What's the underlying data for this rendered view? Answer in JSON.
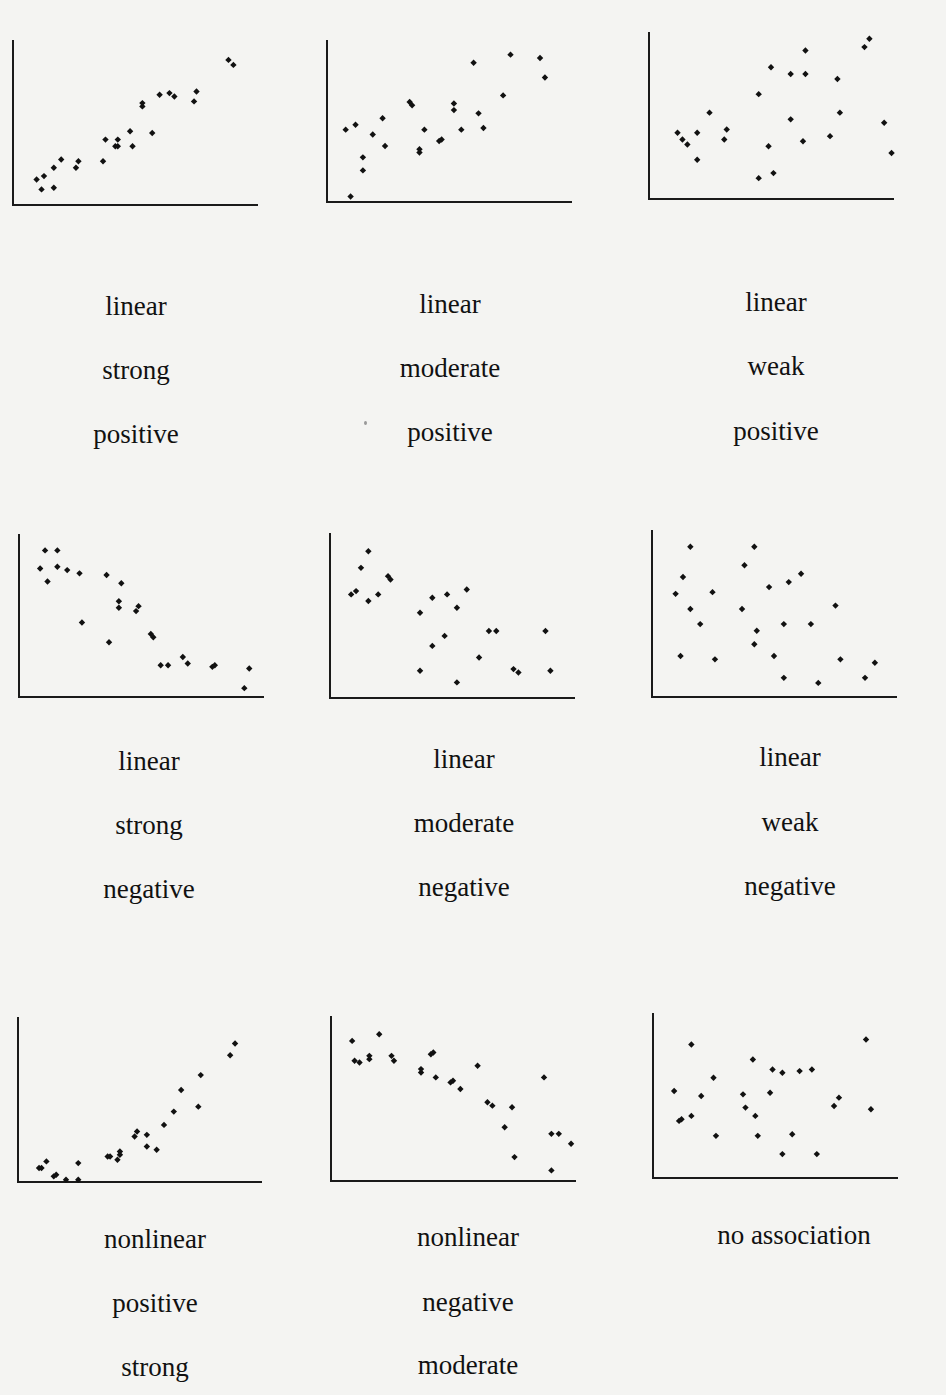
{
  "chart_data": [
    {
      "type": "scatter",
      "title": "linear strong positive",
      "labels": [
        "linear",
        "strong",
        "positive"
      ],
      "form": "linear",
      "strength": "strong",
      "direction": "positive",
      "xlabel": "",
      "ylabel": "",
      "grid": false,
      "legend": null,
      "frame": {
        "x": 12,
        "y": 40,
        "w": 246,
        "h": 166
      },
      "points": [
        [
          0.1,
          0.16
        ],
        [
          0.12,
          0.1
        ],
        [
          0.13,
          0.18
        ],
        [
          0.17,
          0.11
        ],
        [
          0.17,
          0.23
        ],
        [
          0.2,
          0.28
        ],
        [
          0.26,
          0.23
        ],
        [
          0.27,
          0.27
        ],
        [
          0.37,
          0.27
        ],
        [
          0.38,
          0.4
        ],
        [
          0.42,
          0.36
        ],
        [
          0.43,
          0.4
        ],
        [
          0.43,
          0.36
        ],
        [
          0.48,
          0.45
        ],
        [
          0.49,
          0.36
        ],
        [
          0.53,
          0.6
        ],
        [
          0.53,
          0.62
        ],
        [
          0.57,
          0.44
        ],
        [
          0.6,
          0.67
        ],
        [
          0.64,
          0.68
        ],
        [
          0.66,
          0.66
        ],
        [
          0.74,
          0.63
        ],
        [
          0.75,
          0.69
        ],
        [
          0.88,
          0.88
        ],
        [
          0.9,
          0.85
        ]
      ]
    },
    {
      "type": "scatter",
      "title": "linear moderate positive",
      "labels": [
        "linear",
        "moderate",
        "positive"
      ],
      "form": "linear",
      "strength": "moderate",
      "direction": "positive",
      "xlabel": "",
      "ylabel": "",
      "grid": false,
      "legend": null,
      "frame": {
        "x": 326,
        "y": 40,
        "w": 246,
        "h": 163
      },
      "points": [
        [
          0.1,
          0.04
        ],
        [
          0.08,
          0.45
        ],
        [
          0.12,
          0.48
        ],
        [
          0.15,
          0.28
        ],
        [
          0.15,
          0.2
        ],
        [
          0.19,
          0.42
        ],
        [
          0.23,
          0.52
        ],
        [
          0.24,
          0.35
        ],
        [
          0.34,
          0.62
        ],
        [
          0.35,
          0.6
        ],
        [
          0.38,
          0.31
        ],
        [
          0.4,
          0.45
        ],
        [
          0.38,
          0.33
        ],
        [
          0.46,
          0.38
        ],
        [
          0.47,
          0.39
        ],
        [
          0.52,
          0.61
        ],
        [
          0.52,
          0.57
        ],
        [
          0.55,
          0.45
        ],
        [
          0.62,
          0.55
        ],
        [
          0.64,
          0.46
        ],
        [
          0.6,
          0.86
        ],
        [
          0.72,
          0.66
        ],
        [
          0.75,
          0.91
        ],
        [
          0.87,
          0.89
        ],
        [
          0.89,
          0.77
        ]
      ]
    },
    {
      "type": "scatter",
      "title": "linear weak positive",
      "labels": [
        "linear",
        "weak",
        "positive"
      ],
      "form": "linear",
      "strength": "weak",
      "direction": "positive",
      "xlabel": "",
      "ylabel": "",
      "grid": false,
      "legend": null,
      "frame": {
        "x": 648,
        "y": 32,
        "w": 246,
        "h": 168
      },
      "points": [
        [
          0.12,
          0.4
        ],
        [
          0.14,
          0.36
        ],
        [
          0.16,
          0.33
        ],
        [
          0.2,
          0.4
        ],
        [
          0.2,
          0.24
        ],
        [
          0.25,
          0.52
        ],
        [
          0.31,
          0.36
        ],
        [
          0.32,
          0.42
        ],
        [
          0.45,
          0.13
        ],
        [
          0.45,
          0.63
        ],
        [
          0.49,
          0.32
        ],
        [
          0.5,
          0.79
        ],
        [
          0.51,
          0.16
        ],
        [
          0.58,
          0.48
        ],
        [
          0.58,
          0.75
        ],
        [
          0.63,
          0.35
        ],
        [
          0.64,
          0.75
        ],
        [
          0.64,
          0.89
        ],
        [
          0.74,
          0.38
        ],
        [
          0.77,
          0.72
        ],
        [
          0.78,
          0.52
        ],
        [
          0.88,
          0.91
        ],
        [
          0.9,
          0.96
        ],
        [
          0.96,
          0.46
        ],
        [
          0.99,
          0.28
        ]
      ]
    },
    {
      "type": "scatter",
      "title": "linear strong negative",
      "labels": [
        "linear",
        "strong",
        "negative"
      ],
      "form": "linear",
      "strength": "strong",
      "direction": "negative",
      "xlabel": "",
      "ylabel": "",
      "grid": false,
      "legend": null,
      "frame": {
        "x": 18,
        "y": 534,
        "w": 246,
        "h": 164
      },
      "points": [
        [
          0.09,
          0.79
        ],
        [
          0.11,
          0.9
        ],
        [
          0.12,
          0.71
        ],
        [
          0.16,
          0.9
        ],
        [
          0.16,
          0.8
        ],
        [
          0.2,
          0.78
        ],
        [
          0.25,
          0.76
        ],
        [
          0.26,
          0.46
        ],
        [
          0.36,
          0.75
        ],
        [
          0.37,
          0.34
        ],
        [
          0.42,
          0.7
        ],
        [
          0.41,
          0.59
        ],
        [
          0.41,
          0.55
        ],
        [
          0.48,
          0.53
        ],
        [
          0.49,
          0.56
        ],
        [
          0.54,
          0.39
        ],
        [
          0.55,
          0.37
        ],
        [
          0.58,
          0.2
        ],
        [
          0.61,
          0.2
        ],
        [
          0.67,
          0.25
        ],
        [
          0.69,
          0.21
        ],
        [
          0.79,
          0.19
        ],
        [
          0.8,
          0.2
        ],
        [
          0.92,
          0.06
        ],
        [
          0.94,
          0.18
        ]
      ]
    },
    {
      "type": "scatter",
      "title": "linear moderate negative",
      "labels": [
        "linear",
        "moderate",
        "negative"
      ],
      "form": "linear",
      "strength": "moderate",
      "direction": "negative",
      "xlabel": "",
      "ylabel": "",
      "grid": false,
      "legend": null,
      "frame": {
        "x": 329,
        "y": 533,
        "w": 246,
        "h": 166
      },
      "points": [
        [
          0.09,
          0.63
        ],
        [
          0.11,
          0.65
        ],
        [
          0.13,
          0.79
        ],
        [
          0.16,
          0.89
        ],
        [
          0.16,
          0.59
        ],
        [
          0.2,
          0.63
        ],
        [
          0.24,
          0.74
        ],
        [
          0.25,
          0.72
        ],
        [
          0.37,
          0.52
        ],
        [
          0.37,
          0.17
        ],
        [
          0.42,
          0.61
        ],
        [
          0.42,
          0.32
        ],
        [
          0.47,
          0.38
        ],
        [
          0.48,
          0.63
        ],
        [
          0.52,
          0.55
        ],
        [
          0.52,
          0.1
        ],
        [
          0.56,
          0.66
        ],
        [
          0.61,
          0.25
        ],
        [
          0.65,
          0.41
        ],
        [
          0.68,
          0.41
        ],
        [
          0.75,
          0.18
        ],
        [
          0.77,
          0.16
        ],
        [
          0.88,
          0.41
        ],
        [
          0.9,
          0.17
        ]
      ]
    },
    {
      "type": "scatter",
      "title": "linear weak negative",
      "labels": [
        "linear",
        "weak",
        "negative"
      ],
      "form": "linear",
      "strength": "weak",
      "direction": "negative",
      "xlabel": "",
      "ylabel": "",
      "grid": false,
      "legend": null,
      "frame": {
        "x": 651,
        "y": 530,
        "w": 246,
        "h": 168
      },
      "points": [
        [
          0.1,
          0.62
        ],
        [
          0.12,
          0.25
        ],
        [
          0.13,
          0.72
        ],
        [
          0.16,
          0.9
        ],
        [
          0.16,
          0.53
        ],
        [
          0.2,
          0.44
        ],
        [
          0.25,
          0.63
        ],
        [
          0.26,
          0.23
        ],
        [
          0.37,
          0.53
        ],
        [
          0.38,
          0.79
        ],
        [
          0.42,
          0.9
        ],
        [
          0.42,
          0.32
        ],
        [
          0.43,
          0.4
        ],
        [
          0.5,
          0.25
        ],
        [
          0.48,
          0.66
        ],
        [
          0.54,
          0.44
        ],
        [
          0.54,
          0.12
        ],
        [
          0.56,
          0.69
        ],
        [
          0.61,
          0.74
        ],
        [
          0.65,
          0.44
        ],
        [
          0.68,
          0.09
        ],
        [
          0.75,
          0.55
        ],
        [
          0.77,
          0.23
        ],
        [
          0.87,
          0.12
        ],
        [
          0.91,
          0.21
        ]
      ]
    },
    {
      "type": "scatter",
      "title": "nonlinear positive strong",
      "labels": [
        "nonlinear",
        "positive",
        "strong"
      ],
      "form": "nonlinear",
      "strength": "strong",
      "direction": "positive",
      "xlabel": "",
      "ylabel": "",
      "grid": false,
      "legend": null,
      "frame": {
        "x": 17,
        "y": 1017,
        "w": 245,
        "h": 166
      },
      "points": [
        [
          0.09,
          0.09
        ],
        [
          0.1,
          0.09
        ],
        [
          0.12,
          0.13
        ],
        [
          0.15,
          0.04
        ],
        [
          0.16,
          0.05
        ],
        [
          0.2,
          0.02
        ],
        [
          0.25,
          0.12
        ],
        [
          0.25,
          0.02
        ],
        [
          0.37,
          0.16
        ],
        [
          0.38,
          0.16
        ],
        [
          0.41,
          0.14
        ],
        [
          0.42,
          0.19
        ],
        [
          0.42,
          0.17
        ],
        [
          0.48,
          0.28
        ],
        [
          0.49,
          0.31
        ],
        [
          0.53,
          0.22
        ],
        [
          0.53,
          0.29
        ],
        [
          0.57,
          0.2
        ],
        [
          0.6,
          0.35
        ],
        [
          0.64,
          0.43
        ],
        [
          0.67,
          0.56
        ],
        [
          0.74,
          0.46
        ],
        [
          0.75,
          0.65
        ],
        [
          0.87,
          0.77
        ],
        [
          0.89,
          0.84
        ]
      ]
    },
    {
      "type": "scatter",
      "title": "nonlinear negative moderate",
      "labels": [
        "nonlinear",
        "negative",
        "moderate"
      ],
      "form": "nonlinear",
      "strength": "moderate",
      "direction": "negative",
      "xlabel": "",
      "ylabel": "",
      "grid": false,
      "legend": null,
      "frame": {
        "x": 330,
        "y": 1016,
        "w": 246,
        "h": 166
      },
      "points": [
        [
          0.09,
          0.85
        ],
        [
          0.1,
          0.73
        ],
        [
          0.12,
          0.72
        ],
        [
          0.16,
          0.74
        ],
        [
          0.16,
          0.76
        ],
        [
          0.2,
          0.89
        ],
        [
          0.25,
          0.76
        ],
        [
          0.26,
          0.73
        ],
        [
          0.37,
          0.66
        ],
        [
          0.37,
          0.68
        ],
        [
          0.41,
          0.77
        ],
        [
          0.42,
          0.78
        ],
        [
          0.43,
          0.63
        ],
        [
          0.49,
          0.6
        ],
        [
          0.5,
          0.61
        ],
        [
          0.53,
          0.56
        ],
        [
          0.6,
          0.7
        ],
        [
          0.64,
          0.48
        ],
        [
          0.66,
          0.46
        ],
        [
          0.71,
          0.33
        ],
        [
          0.74,
          0.45
        ],
        [
          0.75,
          0.15
        ],
        [
          0.87,
          0.63
        ],
        [
          0.9,
          0.07
        ],
        [
          0.9,
          0.29
        ],
        [
          0.93,
          0.29
        ],
        [
          0.98,
          0.23
        ]
      ]
    },
    {
      "type": "scatter",
      "title": "no association",
      "labels": [
        "no association"
      ],
      "form": "none",
      "strength": "none",
      "direction": "none",
      "xlabel": "",
      "ylabel": "",
      "grid": false,
      "legend": null,
      "frame": {
        "x": 652,
        "y": 1013,
        "w": 246,
        "h": 166
      },
      "points": [
        [
          0.09,
          0.53
        ],
        [
          0.11,
          0.35
        ],
        [
          0.12,
          0.36
        ],
        [
          0.16,
          0.38
        ],
        [
          0.16,
          0.81
        ],
        [
          0.2,
          0.5
        ],
        [
          0.25,
          0.61
        ],
        [
          0.26,
          0.26
        ],
        [
          0.37,
          0.51
        ],
        [
          0.38,
          0.43
        ],
        [
          0.41,
          0.72
        ],
        [
          0.42,
          0.38
        ],
        [
          0.43,
          0.26
        ],
        [
          0.48,
          0.52
        ],
        [
          0.49,
          0.66
        ],
        [
          0.53,
          0.64
        ],
        [
          0.53,
          0.15
        ],
        [
          0.57,
          0.27
        ],
        [
          0.6,
          0.65
        ],
        [
          0.65,
          0.66
        ],
        [
          0.67,
          0.15
        ],
        [
          0.74,
          0.44
        ],
        [
          0.76,
          0.49
        ],
        [
          0.87,
          0.84
        ],
        [
          0.89,
          0.42
        ]
      ]
    }
  ],
  "plots": [
    {
      "label_lines": [
        "linear",
        "strong",
        "positive"
      ]
    },
    {
      "label_lines": [
        "linear",
        "moderate",
        "positive"
      ]
    },
    {
      "label_lines": [
        "linear",
        "weak",
        "positive"
      ]
    },
    {
      "label_lines": [
        "linear",
        "strong",
        "negative"
      ]
    },
    {
      "label_lines": [
        "linear",
        "moderate",
        "negative"
      ]
    },
    {
      "label_lines": [
        "linear",
        "weak",
        "negative"
      ]
    },
    {
      "label_lines": [
        "nonlinear",
        "positive",
        "strong"
      ]
    },
    {
      "label_lines": [
        "nonlinear",
        "negative",
        "moderate"
      ]
    },
    {
      "label_lines": [
        "no association"
      ]
    }
  ]
}
